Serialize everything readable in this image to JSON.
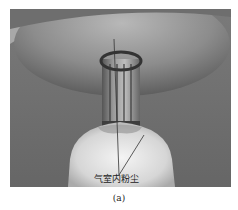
{
  "figure": {
    "annotation": "气室内粉尘",
    "caption": "(a)"
  }
}
